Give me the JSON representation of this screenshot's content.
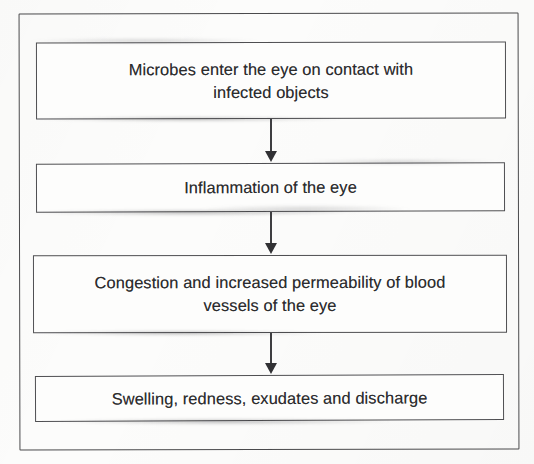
{
  "document": {
    "type": "flowchart",
    "orientation": "vertical",
    "title": "Pathophysiology of eye infection flowchart",
    "background_color": "#fcfcfb",
    "border_color": "#4a4a4c",
    "box_border_color": "#4f4f52",
    "box_fill_color": "#fdfdfc",
    "text_color": "#2c2c2e",
    "arrow_color": "#313134"
  },
  "flow": {
    "nodes": [
      {
        "id": "node-1",
        "order": 1,
        "text": "Microbes enter the eye on contact with\ninfected objects",
        "lines": [
          "Microbes enter the eye on contact with",
          "infected objects"
        ]
      },
      {
        "id": "node-2",
        "order": 2,
        "text": "Inflammation of the eye",
        "lines": [
          "Inflammation of the eye"
        ]
      },
      {
        "id": "node-3",
        "order": 3,
        "text": "Congestion and increased permeability of blood\nvessels of the eye",
        "lines": [
          "Congestion and increased permeability of blood",
          "vessels of the eye"
        ]
      },
      {
        "id": "node-4",
        "order": 4,
        "text": "Swelling, redness, exudates and discharge",
        "lines": [
          "Swelling, redness, exudates and discharge"
        ]
      }
    ],
    "connectors": [
      {
        "id": "arrow-1",
        "from": "node-1",
        "to": "node-2",
        "shape": "down-arrow"
      },
      {
        "id": "arrow-2",
        "from": "node-2",
        "to": "node-3",
        "shape": "down-arrow"
      },
      {
        "id": "arrow-3",
        "from": "node-3",
        "to": "node-4",
        "shape": "down-arrow"
      }
    ]
  }
}
